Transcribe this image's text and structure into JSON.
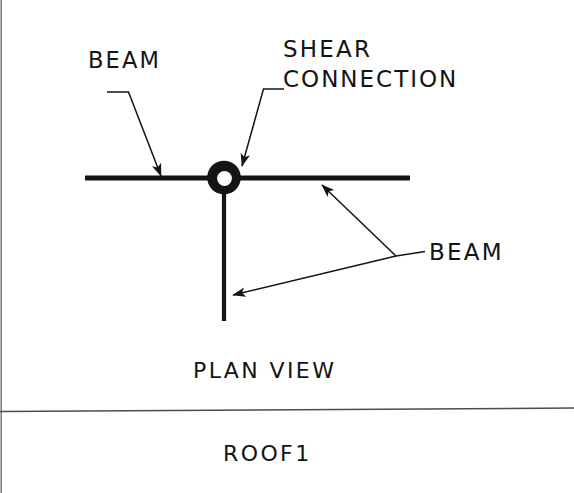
{
  "sheet": {
    "width": 574,
    "height": 493,
    "background_color": "#ffffff",
    "ink_color": "#141414",
    "title_caption": "ROOF1"
  },
  "diagram": {
    "view_caption": "PLAN VIEW",
    "annotations": [
      {
        "id": "beam-left",
        "label": "BEAM"
      },
      {
        "id": "shear-connection",
        "label_line1": "SHEAR",
        "label_line2": "CONNECTION"
      },
      {
        "id": "beam-right",
        "label": "BEAM"
      }
    ],
    "geometry": {
      "horizontal_beam": {
        "x1": 85,
        "y1": 178,
        "x2": 410,
        "y2": 178,
        "stroke_width": 5
      },
      "vertical_beam": {
        "x1": 224,
        "y1": 193,
        "x2": 224,
        "y2": 320,
        "stroke_width": 4
      },
      "shear_connection_ring": {
        "cx": 224,
        "cy": 177,
        "outer_r": 17,
        "inner_r": 7.5
      },
      "divider_rule": {
        "x1": 0,
        "y1": 411,
        "x2": 574,
        "y2": 408,
        "stroke_width": 1.4
      },
      "left_border_rule": {
        "x1": 1,
        "y1": 0,
        "x2": 1,
        "y2": 493,
        "stroke_width": 1.2
      },
      "leaders": [
        {
          "for": "beam-left",
          "points": "108,92 128,92 160,175",
          "arrow_at": [
            160,
            175
          ],
          "arrow_angle": 69
        },
        {
          "for": "shear-connection",
          "points": "283,89 264,89 243,165",
          "arrow_at": [
            243,
            165
          ],
          "arrow_angle": 105
        },
        {
          "for": "beam-right-branch-a",
          "points": "424,252 395,256 321,184",
          "arrow_at": [
            321,
            184
          ],
          "arrow_angle": 224
        },
        {
          "for": "beam-right-branch-b",
          "points": "395,256 231,295",
          "arrow_at": [
            231,
            295
          ],
          "arrow_angle": 193
        }
      ]
    }
  }
}
